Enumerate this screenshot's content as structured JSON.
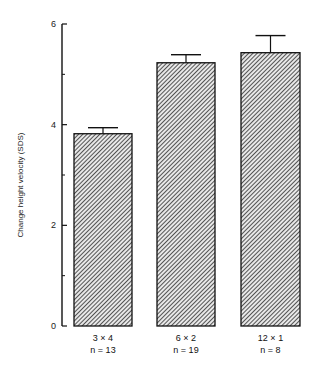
{
  "chart_data": {
    "type": "bar",
    "title": "",
    "xlabel": "",
    "ylabel": "Change height velocity (SDS)",
    "ylim": [
      0,
      6
    ],
    "yticks": [
      0,
      2,
      4,
      6
    ],
    "minor_yticks": [
      1,
      3,
      5
    ],
    "grid": false,
    "legend": null,
    "pattern": "diagonal-hatch",
    "categories": [
      "3 x 4",
      "6 x 2",
      "12 x 1"
    ],
    "n_labels": [
      "n = 13",
      "n = 19",
      "n = 8"
    ],
    "values": [
      3.82,
      5.23,
      5.43
    ],
    "error_upper": [
      3.94,
      5.39,
      5.77
    ]
  },
  "caption_fragment": "(caption text cut off at bottom edge)"
}
